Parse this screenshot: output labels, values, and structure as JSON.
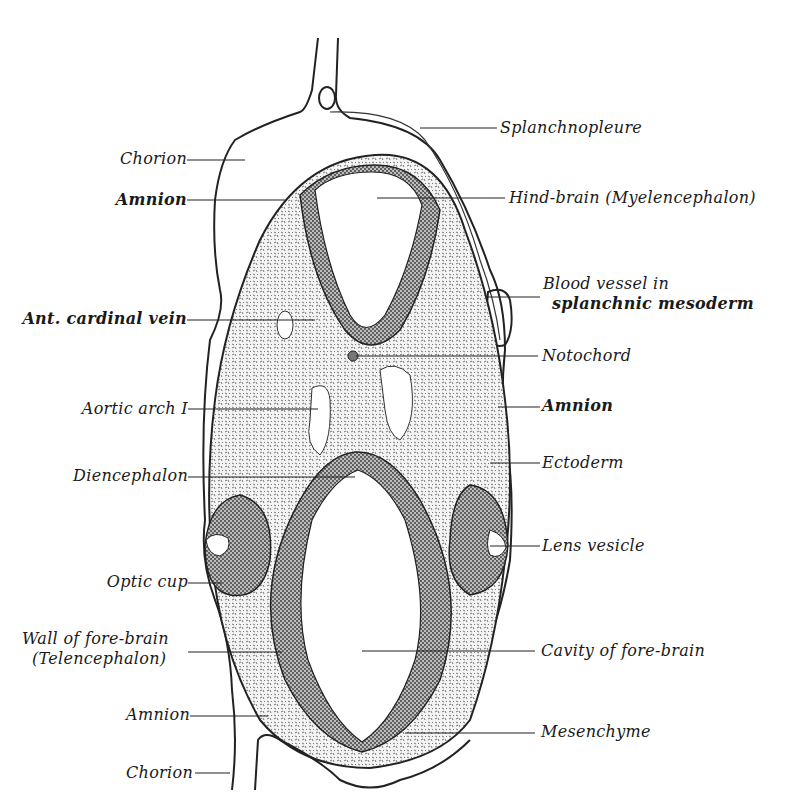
{
  "figure": {
    "labels_left": [
      {
        "id": "chorion-top",
        "text": "Chorion"
      },
      {
        "id": "amnion-top",
        "text": "Amnion"
      },
      {
        "id": "ant-cardinal-vein",
        "text": "Ant. cardinal vein"
      },
      {
        "id": "aortic-arch",
        "text": "Aortic arch I"
      },
      {
        "id": "diencephalon",
        "text": "Diencephalon"
      },
      {
        "id": "optic-cup",
        "text": "Optic cup"
      },
      {
        "id": "wall-fore-brain-1",
        "text": "Wall of fore-brain"
      },
      {
        "id": "wall-fore-brain-2",
        "text": "(Telencephalon)"
      },
      {
        "id": "amnion-bottom",
        "text": "Amnion"
      },
      {
        "id": "chorion-bottom",
        "text": "Chorion"
      }
    ],
    "labels_right": [
      {
        "id": "splanchnopleure",
        "text": "Splanchnopleure"
      },
      {
        "id": "hind-brain",
        "text": "Hind-brain (Myelencephalon)"
      },
      {
        "id": "blood-vessel-1",
        "text": "Blood vessel in"
      },
      {
        "id": "blood-vessel-2",
        "text": "splanchnic mesoderm"
      },
      {
        "id": "notochord",
        "text": "Notochord"
      },
      {
        "id": "amnion-right",
        "text": "Amnion"
      },
      {
        "id": "ectoderm",
        "text": "Ectoderm"
      },
      {
        "id": "lens-vesicle",
        "text": "Lens vesicle"
      },
      {
        "id": "cavity-fore-brain",
        "text": "Cavity of fore-brain"
      },
      {
        "id": "mesenchyme",
        "text": "Mesenchyme"
      }
    ]
  }
}
